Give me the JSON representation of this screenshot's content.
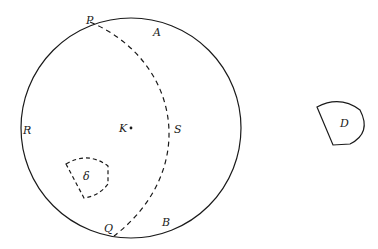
{
  "diagram": {
    "labels": {
      "P": "P",
      "A": "A",
      "R": "R",
      "K": "K",
      "S": "S",
      "delta": "δ",
      "Q": "Q",
      "B": "B",
      "D": "D"
    },
    "colors": {
      "stroke": "#1a1a1a",
      "background": "#ffffff"
    }
  }
}
